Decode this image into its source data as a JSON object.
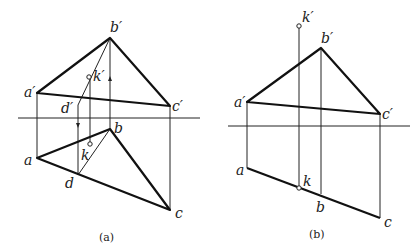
{
  "figure_a": {
    "caption": "(a)",
    "labels": {
      "b_prime": "b′",
      "k_prime": "k′",
      "a_prime": "a′",
      "d_prime": "d′",
      "c_prime": "c′",
      "a": "a",
      "b": "b",
      "k": "k",
      "d": "d",
      "c": "c"
    }
  },
  "figure_b": {
    "caption": "(b)",
    "labels": {
      "k_prime": "k′",
      "b_prime": "b′",
      "a_prime": "a′",
      "c_prime": "c′",
      "a": "a",
      "k": "k",
      "b": "b",
      "c": "c"
    }
  }
}
